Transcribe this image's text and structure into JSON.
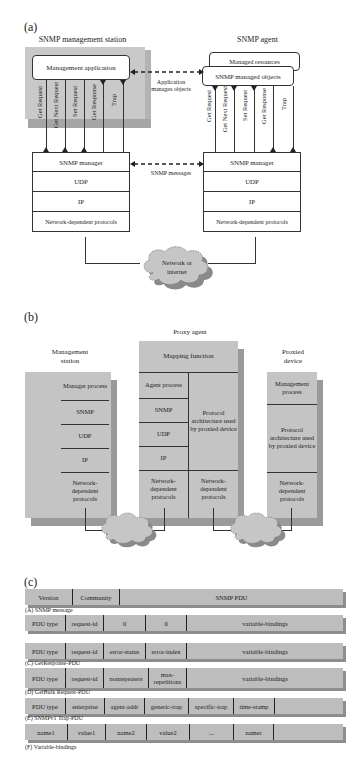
{
  "panel_a": {
    "label": "(a)",
    "left_title": "SNMP management station",
    "right_title": "SNMP agent",
    "management_application": "Management application",
    "managed_resources": "Managed resources",
    "snmp_managed_objects": "SNMP managed objects",
    "app_link_label_1": "Application",
    "app_link_label_2": "manages objects",
    "snmp_messages_label": "SNMP messages",
    "operations": [
      "Get Request",
      "Get Next Request",
      "Set Request",
      "Get Response",
      "Trap"
    ],
    "left_stack": [
      "SNMP manager",
      "UDP",
      "IP",
      "Network-dependent protocols"
    ],
    "right_stack": [
      "SNMP manager",
      "UDP",
      "IP",
      "Network-dependent protocols"
    ],
    "cloud_line1": "Network or",
    "cloud_line2": "internet"
  },
  "panel_b": {
    "label": "(b)",
    "proxy_title": "Proxy agent",
    "mgmt_title_1": "Management",
    "mgmt_title_2": "station",
    "proxied_title_1": "Proxied",
    "proxied_title_2": "device",
    "mgmt_rows": [
      "Manager process",
      "SNMP",
      "UDP",
      "IP",
      "Network- dependent protocols"
    ],
    "mapping_function": "Mapping function",
    "proxy_left_rows": [
      "Agent process",
      "SNMP",
      "UDP",
      "IP",
      "Network- dependent protocols"
    ],
    "proxy_right_rows": [
      "Protocol architecture used by proxied device",
      "Network- dependent protocols"
    ],
    "proxied_rows": [
      "Management process",
      "Protocol architecture used by proxied device",
      "Network- dependent protocols"
    ]
  },
  "panel_c": {
    "label": "(c)",
    "rows": [
      {
        "cells": [
          "Version",
          "Community",
          "SNMP PDU"
        ],
        "caption": "(A) SNMP message"
      },
      {
        "cells": [
          "PDU type",
          "request-id",
          "0",
          "0",
          "variable-bindings"
        ],
        "caption": ""
      },
      {
        "cells": [
          "PDU type",
          "request-id",
          "error-status",
          "error-index",
          "variable-bindings"
        ],
        "caption": "(C) GetResponse-PDU"
      },
      {
        "cells": [
          "PDU type",
          "request-id",
          "nonrepeaters",
          "max- repetitions",
          "variable-bindings"
        ],
        "caption": "(D) GetBulk Request-PDU"
      },
      {
        "cells": [
          "PDU type",
          "enterprise",
          "agent-addr",
          "generic-trap",
          "specific-trap",
          "time-stamp",
          ""
        ],
        "caption": "(E) SNMPv1 Trap-PDU"
      },
      {
        "cells": [
          "name1",
          "value1",
          "name2",
          "value2",
          "...",
          "namer",
          ""
        ],
        "caption": "(F) Variable-bindings"
      }
    ]
  }
}
